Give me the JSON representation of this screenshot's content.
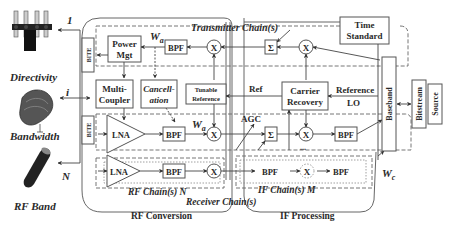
{
  "left_panel": {
    "directivity_label": "Directivity",
    "bandwidth_label": "Bandwidth",
    "rf_band_label": "RF Band",
    "port_top": "1",
    "port_mid": "i",
    "port_bottom": "N"
  },
  "transmitter": {
    "title": "Transmitter Chain(s)",
    "bite": "BITE",
    "power_mgt_line1": "Power",
    "power_mgt_line2": "Mgt",
    "bpf": "BPF",
    "wa": "W",
    "wa_sub": "a",
    "mixer": "X",
    "sum": "Σ",
    "time_standard_line1": "Time",
    "time_standard_line2": "Standard"
  },
  "middle": {
    "multi_coupler_line1": "Multi-",
    "multi_coupler_line2": "Coupler",
    "cancellation_line1": "Cancell-",
    "cancellation_line2": "ation",
    "tunable_ref_line1": "Tunable",
    "tunable_ref_line2": "Reference",
    "ref": "Ref",
    "carrier_recovery_line1": "Carrier",
    "carrier_recovery_line2": "Recovery",
    "reference_lo_line1": "Reference",
    "reference_lo_line2": "LO"
  },
  "receiver": {
    "bite": "BITE",
    "lna": "LNA",
    "bpf": "BPF",
    "mixer": "X",
    "agc": "AGC",
    "sum": "Σ",
    "ellipsis": "...",
    "rf_chains_label": "RF Chain(s) N",
    "if_chains_label": "IF Chain(s) M",
    "receiver_chains_label": "Receiver Chain(s)",
    "rf_conversion_label": "RF Conversion",
    "if_processing_label": "IF Processing",
    "wc": "W",
    "wc_sub": "c"
  },
  "right": {
    "baseband": "Baseband",
    "bitstream": "Bitstream",
    "source": "Source"
  }
}
